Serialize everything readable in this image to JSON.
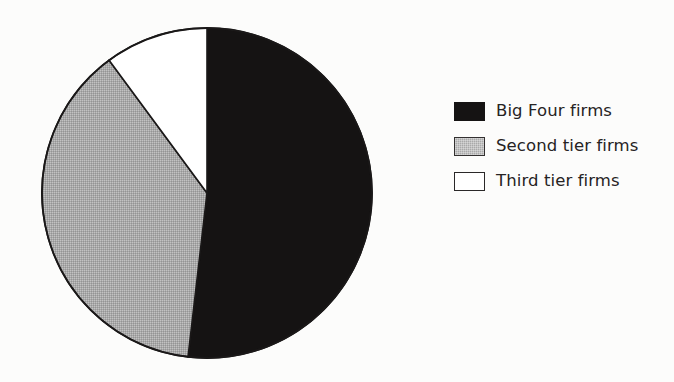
{
  "figure": {
    "background_color": "#fcfcfb",
    "caption": ""
  },
  "chart_data": {
    "type": "pie",
    "title": "",
    "subtitle": "",
    "xlabel": "",
    "ylabel": "",
    "grid": false,
    "legend_position": "right",
    "start_angle_deg": 0,
    "direction": "clockwise",
    "categories": [
      "Big Four firms",
      "Second tier firms",
      "Third tier firms"
    ],
    "values": [
      51.8,
      38.1,
      10.1
    ],
    "value_unit": "percent",
    "colors": [
      "#151313",
      "#a9a9a9",
      "#ffffff"
    ],
    "edge_color": "#1a1818",
    "slices": [
      {
        "label": "Big Four firms",
        "value": 51.8,
        "color": "#151313",
        "fill": "solid-black",
        "start_angle_deg": 0,
        "end_angle_deg": 186.6
      },
      {
        "label": "Second tier firms",
        "value": 38.1,
        "color": "#a9a9a9",
        "fill": "stippled-gray",
        "start_angle_deg": 186.6,
        "end_angle_deg": 323.6
      },
      {
        "label": "Third tier firms",
        "value": 10.1,
        "color": "#ffffff",
        "fill": "solid-white",
        "start_angle_deg": 323.6,
        "end_angle_deg": 360
      }
    ],
    "geometry": {
      "center_x": 169,
      "center_y": 169,
      "radius": 165
    }
  },
  "legend": {
    "items": [
      {
        "label": "Big Four firms",
        "swatch": "black"
      },
      {
        "label": "Second tier firms",
        "swatch": "gray"
      },
      {
        "label": "Third tier firms",
        "swatch": "white"
      }
    ]
  }
}
